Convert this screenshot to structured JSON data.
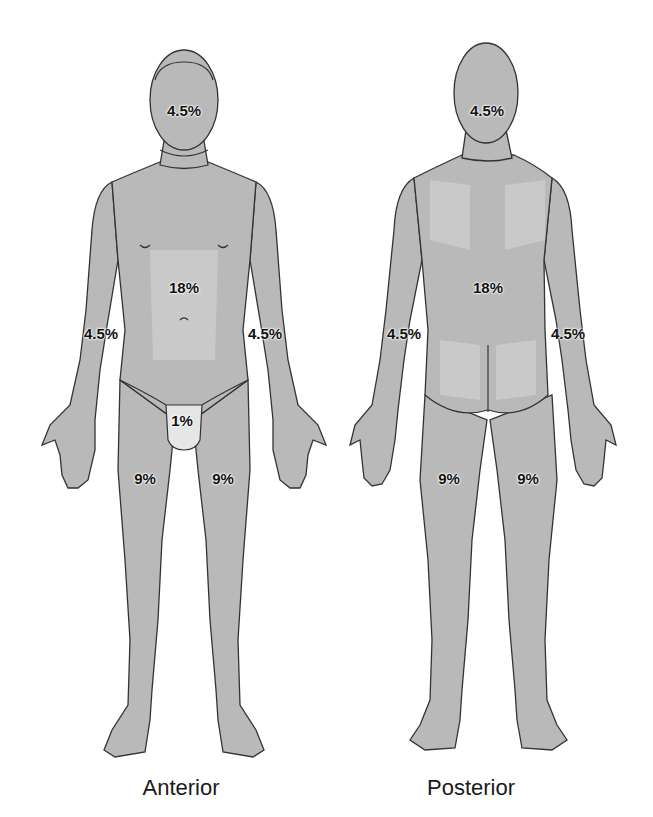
{
  "diagram": {
    "colors": {
      "body_fill": "#b9b9b9",
      "outline": "#333333",
      "label": "#111111",
      "background": "#ffffff"
    },
    "anterior": {
      "caption": "Anterior",
      "regions": {
        "head": "4.5%",
        "trunk": "18%",
        "left_arm": "4.5%",
        "right_arm": "4.5%",
        "genitalia": "1%",
        "left_leg": "9%",
        "right_leg": "9%"
      }
    },
    "posterior": {
      "caption": "Posterior",
      "regions": {
        "head": "4.5%",
        "trunk": "18%",
        "left_arm": "4.5%",
        "right_arm": "4.5%",
        "left_leg": "9%",
        "right_leg": "9%"
      }
    }
  }
}
